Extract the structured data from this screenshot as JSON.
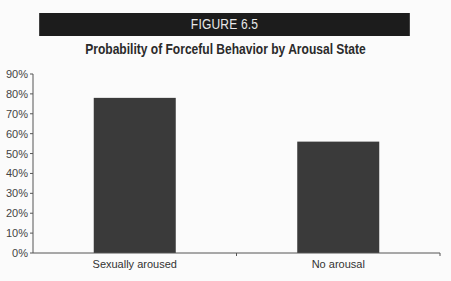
{
  "figure": {
    "label": "FIGURE 6.5",
    "banner_color": "#1c1c1c"
  },
  "chart_data": {
    "type": "bar",
    "title": "Probability of Forceful Behavior by Arousal State",
    "categories": [
      "Sexually aroused",
      "No arousal"
    ],
    "values": [
      78,
      56
    ],
    "unit": "%",
    "xlabel": "",
    "ylabel": "",
    "ylim": [
      0,
      90
    ],
    "yticks": [
      0,
      10,
      20,
      30,
      40,
      50,
      60,
      70,
      80,
      90
    ],
    "ytick_labels": [
      "0%",
      "10%",
      "20%",
      "30%",
      "40%",
      "50%",
      "60%",
      "70%",
      "80%",
      "90%"
    ],
    "grid": false,
    "legend": null,
    "bar_color": "#3a3a3a"
  }
}
